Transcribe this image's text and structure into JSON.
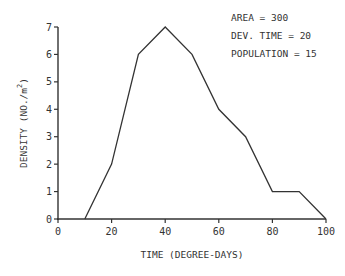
{
  "chart_data": {
    "type": "line",
    "title": "",
    "xlabel": "TIME (DEGREE-DAYS)",
    "ylabel": "DENSITY (NO./m²)",
    "ylabel_main": "DENSITY (NO./m",
    "ylabel_sup": "2",
    "ylabel_close": ")",
    "xlim": [
      0,
      100
    ],
    "ylim": [
      0,
      7
    ],
    "xticks": [
      0,
      20,
      40,
      60,
      80,
      100
    ],
    "yticks": [
      0,
      1,
      2,
      3,
      4,
      5,
      6,
      7
    ],
    "grid": false,
    "series": [
      {
        "name": "density",
        "x": [
          10,
          20,
          30,
          40,
          50,
          60,
          70,
          80,
          90,
          100
        ],
        "y": [
          0,
          2,
          6,
          7,
          6,
          4,
          3,
          1,
          1,
          0
        ]
      }
    ],
    "annotations": [
      "AREA = 300",
      "DEV. TIME =  20",
      "POPULATION =  15"
    ]
  }
}
